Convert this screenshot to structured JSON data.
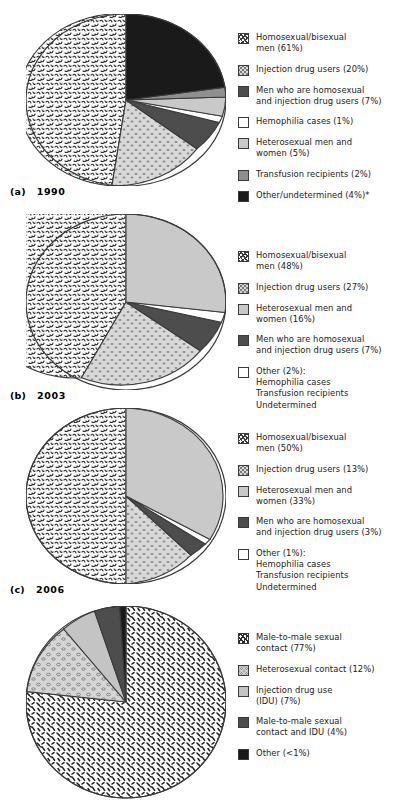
{
  "figure": {
    "type": "pie-chart-figure",
    "background": "#ffffff",
    "accent_dark": "#1a1a1a"
  },
  "palette": {
    "homosexual_bisexual": "#f2f2f2",
    "injection_drug": "#d8d8d8",
    "heterosexual": "#c9c9c9",
    "men_homo_and_idu": "#4d4d4d",
    "transfusion": "#8f8f8f",
    "hemophilia": "#ffffff",
    "other_undetermined": "#1a1a1a",
    "male_to_male": "#ffffff",
    "heterosexual_contact": "#d5d5d5",
    "idu_use": "#c4c4c4",
    "mm_and_idu": "#4d4d4d",
    "other_lt1": "#1a1a1a",
    "outline": "#3a3a3a"
  },
  "charts": [
    {
      "id": "chart-a",
      "caption_label": "(a)",
      "caption_year": "1990",
      "legend": [
        {
          "name": "homosexual-bisexual-men",
          "text": "Homosexual/bisexual",
          "text2": "men (61%)",
          "swatch": "scribble",
          "fill": "#f2f2f2"
        },
        {
          "name": "injection-drug-users",
          "text": "Injection drug users (20%)",
          "text2": "",
          "swatch": "speckle",
          "fill": "#d8d8d8"
        },
        {
          "name": "men-homosexual-and-idu",
          "text": "Men who are homosexual",
          "text2": "and injection drug users (7%)",
          "swatch": "solid-dark",
          "fill": "#4d4d4d"
        },
        {
          "name": "hemophilia-cases",
          "text": "Hemophilia cases (1%)",
          "text2": "",
          "swatch": "white",
          "fill": "#ffffff"
        },
        {
          "name": "heterosexual-men-women",
          "text": "Heterosexual men and",
          "text2": "women (5%)",
          "swatch": "light-gray",
          "fill": "#c9c9c9"
        },
        {
          "name": "transfusion-recipients",
          "text": "Transfusion recipients (2%)",
          "text2": "",
          "swatch": "mid-gray",
          "fill": "#8f8f8f"
        },
        {
          "name": "other-undetermined",
          "text": "Other/undetermined (4%)*",
          "text2": "",
          "swatch": "black",
          "fill": "#1a1a1a"
        }
      ]
    },
    {
      "id": "chart-b",
      "caption_label": "(b)",
      "caption_year": "2003",
      "legend": [
        {
          "name": "homosexual-bisexual-men",
          "text": "Homosexual/bisexual",
          "text2": "men (48%)",
          "swatch": "scribble",
          "fill": "#f2f2f2"
        },
        {
          "name": "injection-drug-users",
          "text": "Injection drug users (27%)",
          "text2": "",
          "swatch": "speckle",
          "fill": "#d8d8d8"
        },
        {
          "name": "heterosexual-men-women",
          "text": "Heterosexual men and",
          "text2": "women (16%)",
          "swatch": "light-gray",
          "fill": "#c9c9c9"
        },
        {
          "name": "men-homosexual-and-idu",
          "text": "Men who are homosexual",
          "text2": "and injection drug users (7%)",
          "swatch": "solid-dark",
          "fill": "#4d4d4d"
        },
        {
          "name": "other-group",
          "text": "Other (2%):",
          "text2": "Hemophilia cases|Transfusion recipients|Undetermined",
          "swatch": "white",
          "fill": "#ffffff"
        }
      ]
    },
    {
      "id": "chart-c",
      "caption_label": "(c)",
      "caption_year": "2006",
      "legend": [
        {
          "name": "homosexual-bisexual-men",
          "text": "Homosexual/bisexual",
          "text2": "men (50%)",
          "swatch": "scribble",
          "fill": "#f2f2f2"
        },
        {
          "name": "injection-drug-users",
          "text": "Injection drug users (13%)",
          "text2": "",
          "swatch": "speckle",
          "fill": "#d8d8d8"
        },
        {
          "name": "heterosexual-men-women",
          "text": "Heterosexual men and",
          "text2": "women (33%)",
          "swatch": "light-gray",
          "fill": "#c9c9c9"
        },
        {
          "name": "men-homosexual-and-idu",
          "text": "Men who are homosexual",
          "text2": "and injection drug users (3%)",
          "swatch": "solid-dark",
          "fill": "#4d4d4d"
        },
        {
          "name": "other-group",
          "text": "Other (1%):",
          "text2": "Hemophilia cases|Transfusion recipients|Undetermined",
          "swatch": "white",
          "fill": "#ffffff"
        }
      ]
    },
    {
      "id": "chart-d",
      "caption_label": "",
      "caption_year": "",
      "legend": [
        {
          "name": "male-to-male-sexual-contact",
          "text": "Male-to-male sexual",
          "text2": "contact (77%)",
          "swatch": "dash",
          "fill": "#ffffff"
        },
        {
          "name": "heterosexual-contact",
          "text": "Heterosexual contact (12%)",
          "text2": "",
          "swatch": "speckle",
          "fill": "#d5d5d5"
        },
        {
          "name": "injection-drug-use",
          "text": "Injection drug use",
          "text2": "(IDU) (7%)",
          "swatch": "light-gray",
          "fill": "#c4c4c4"
        },
        {
          "name": "male-to-male-and-idu",
          "text": "Male-to-male sexual",
          "text2": "contact and IDU (4%)",
          "swatch": "solid-dark",
          "fill": "#4d4d4d"
        },
        {
          "name": "other-lt-1",
          "text": "Other (<1%)",
          "text2": "",
          "swatch": "black",
          "fill": "#1a1a1a"
        }
      ]
    }
  ],
  "chart_data": [
    {
      "type": "pie",
      "title": "1990",
      "label": "(a)",
      "categories": [
        "Homosexual/bisexual men",
        "Injection drug users",
        "Men who are homosexual and injection drug users",
        "Hemophilia cases",
        "Heterosexual men and women",
        "Transfusion recipients",
        "Other/undetermined"
      ],
      "values": [
        61,
        20,
        7,
        1,
        5,
        2,
        4
      ],
      "unit": "%",
      "note": "* Other/undetermined",
      "legend_position": "right"
    },
    {
      "type": "pie",
      "title": "2003",
      "label": "(b)",
      "categories": [
        "Homosexual/bisexual men",
        "Injection drug users",
        "Heterosexual men and women",
        "Men who are homosexual and injection drug users",
        "Other (Hemophilia cases, Transfusion recipients, Undetermined)"
      ],
      "values": [
        48,
        27,
        16,
        7,
        2
      ],
      "unit": "%",
      "legend_position": "right"
    },
    {
      "type": "pie",
      "title": "2006",
      "label": "(c)",
      "categories": [
        "Homosexual/bisexual men",
        "Injection drug users",
        "Heterosexual men and women",
        "Men who are homosexual and injection drug users",
        "Other (Hemophilia cases, Transfusion recipients, Undetermined)"
      ],
      "values": [
        50,
        13,
        33,
        3,
        1
      ],
      "unit": "%",
      "legend_position": "right"
    },
    {
      "type": "pie",
      "title": "",
      "label": "",
      "categories": [
        "Male-to-male sexual contact",
        "Heterosexual contact",
        "Injection drug use (IDU)",
        "Male-to-male sexual contact and IDU",
        "Other"
      ],
      "values": [
        77,
        12,
        7,
        4,
        0.6
      ],
      "unit": "%",
      "legend_position": "right"
    }
  ]
}
